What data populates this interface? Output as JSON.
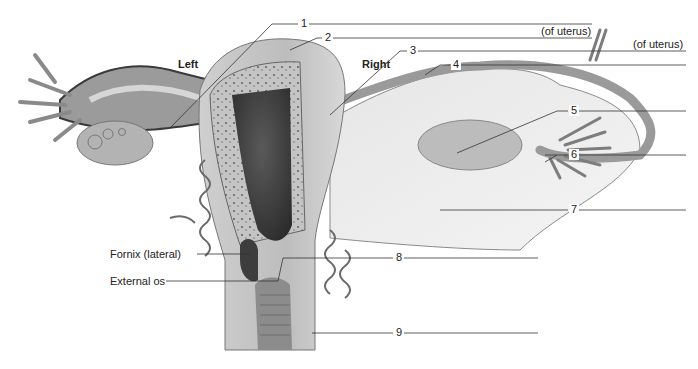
{
  "figure": {
    "side_labels": {
      "left": "Left",
      "right": "Right"
    },
    "numbered_labels": [
      {
        "number": "1",
        "answer_blank": true,
        "suffix": ""
      },
      {
        "number": "2",
        "answer_blank": true,
        "suffix": "(of uterus)"
      },
      {
        "number": "3",
        "answer_blank": true,
        "suffix": "(of uterus)"
      },
      {
        "number": "4",
        "answer_blank": true,
        "suffix": ""
      },
      {
        "number": "5",
        "answer_blank": true,
        "suffix": ""
      },
      {
        "number": "6",
        "answer_blank": true,
        "suffix": ""
      },
      {
        "number": "7",
        "answer_blank": true,
        "suffix": ""
      },
      {
        "number": "8",
        "answer_blank": true,
        "suffix": ""
      },
      {
        "number": "9",
        "answer_blank": true,
        "suffix": ""
      }
    ],
    "named_labels": [
      {
        "text": "Fornix (lateral)"
      },
      {
        "text": "External os"
      }
    ],
    "colors": {
      "ink": "#222222",
      "tissue_light": "#d9d9d9",
      "tissue_mid": "#a8a8a8",
      "tissue_dark": "#3a3a3a",
      "background": "#ffffff"
    }
  }
}
